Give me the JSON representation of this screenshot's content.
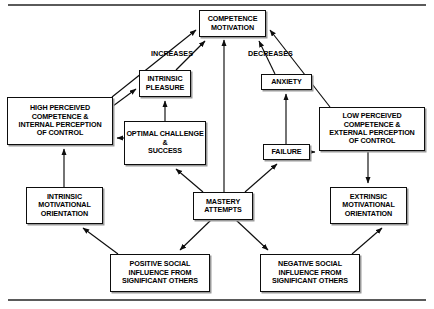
{
  "diagram": {
    "frame": {
      "top_rule": true,
      "bottom_rule": true,
      "rule_color": "#5a5a5a"
    },
    "nodes": [
      {
        "id": "competence-motivation",
        "text": "COMPETENCE\nMOTIVATION",
        "x": 199,
        "y": 10,
        "w": 67,
        "h": 27,
        "font": 7.2
      },
      {
        "id": "intrinsic-pleasure",
        "text": "INTRINSIC\nPLEASURE",
        "x": 139,
        "y": 70,
        "w": 52,
        "h": 27,
        "font": 7.2
      },
      {
        "id": "anxiety",
        "text": "ANXIETY",
        "x": 261,
        "y": 74,
        "w": 51,
        "h": 16,
        "font": 7.2
      },
      {
        "id": "high-perceived-competence",
        "text": "HIGH PERCEIVED\nCOMPETENCE &\nINTERNAL PERCEPTION\nOF CONTROL",
        "x": 7,
        "y": 97,
        "w": 106,
        "h": 48,
        "font": 7.2
      },
      {
        "id": "low-perceived-competence",
        "text": "LOW PERCEIVED\nCOMPETENCE &\nEXTERNAL PERCEPTION\nOF CONTROL",
        "x": 319,
        "y": 107,
        "w": 106,
        "h": 44,
        "font": 7.2
      },
      {
        "id": "optimal-challenge-success",
        "text": "OPTIMAL CHALLENGE\n&\nSUCCESS",
        "x": 124,
        "y": 121,
        "w": 82,
        "h": 44,
        "font": 7.2
      },
      {
        "id": "failure",
        "text": "FAILURE",
        "x": 263,
        "y": 144,
        "w": 47,
        "h": 16,
        "font": 7.2
      },
      {
        "id": "intrinsic-motivational-orientation",
        "text": "INTRINSIC\nMOTIVATIONAL\nORIENTATION",
        "x": 26,
        "y": 187,
        "w": 77,
        "h": 37,
        "font": 7.2
      },
      {
        "id": "mastery-attempts",
        "text": "MASTERY\nATTEMPTS",
        "x": 193,
        "y": 192,
        "w": 60,
        "h": 28,
        "font": 7.2
      },
      {
        "id": "extrinsic-motivational-orientation",
        "text": "EXTRINSIC\nMOTIVATIONAL\nORIENTATION",
        "x": 330,
        "y": 187,
        "w": 77,
        "h": 37,
        "font": 7.2
      },
      {
        "id": "positive-social-influence",
        "text": "POSITIVE SOCIAL\nINFLUENCE FROM\nSIGNIFICANT OTHERS",
        "x": 110,
        "y": 254,
        "w": 100,
        "h": 38,
        "font": 7.2
      },
      {
        "id": "negative-social-influence",
        "text": "NEGATIVE SOCIAL\nINFLUENCE FROM\nSIGNIFICANT OTHERS",
        "x": 260,
        "y": 254,
        "w": 100,
        "h": 38,
        "font": 7.2
      }
    ],
    "edge_labels": [
      {
        "id": "increases-label",
        "text": "INCREASES",
        "x": 151,
        "y": 49,
        "font": 7.2
      },
      {
        "id": "decreases-label",
        "text": "DECREASES",
        "x": 248,
        "y": 49,
        "font": 7.2
      }
    ],
    "edges": [
      {
        "id": "high-perceived-to-competence-motivation",
        "from": "high-perceived-competence",
        "to": "competence-motivation"
      },
      {
        "id": "intrinsic-pleasure-to-competence-motivation",
        "from": "intrinsic-pleasure",
        "to": "competence-motivation"
      },
      {
        "id": "mastery-attempts-to-competence-motivation",
        "from": "mastery-attempts",
        "to": "competence-motivation"
      },
      {
        "id": "anxiety-to-competence-motivation",
        "from": "anxiety",
        "to": "competence-motivation"
      },
      {
        "id": "low-perceived-to-competence-motivation",
        "from": "low-perceived-competence",
        "to": "competence-motivation"
      },
      {
        "id": "high-perceived-to-intrinsic-pleasure",
        "from": "high-perceived-competence",
        "to": "intrinsic-pleasure"
      },
      {
        "id": "optimal-challenge-to-intrinsic-pleasure",
        "from": "optimal-challenge-success",
        "to": "intrinsic-pleasure"
      },
      {
        "id": "optimal-challenge-to-high-perceived",
        "from": "optimal-challenge-success",
        "to": "high-perceived-competence"
      },
      {
        "id": "failure-to-anxiety",
        "from": "failure",
        "to": "anxiety"
      },
      {
        "id": "failure-to-low-perceived",
        "from": "failure",
        "to": "low-perceived-competence"
      },
      {
        "id": "intrinsic-orientation-to-high-perceived",
        "from": "intrinsic-motivational-orientation",
        "to": "high-perceived-competence"
      },
      {
        "id": "low-perceived-to-extrinsic-orientation",
        "from": "low-perceived-competence",
        "to": "extrinsic-motivational-orientation"
      },
      {
        "id": "mastery-attempts-to-optimal-challenge",
        "from": "mastery-attempts",
        "to": "optimal-challenge-success"
      },
      {
        "id": "mastery-attempts-to-failure",
        "from": "mastery-attempts",
        "to": "failure"
      },
      {
        "id": "mastery-attempts-to-positive-social",
        "from": "mastery-attempts",
        "to": "positive-social-influence"
      },
      {
        "id": "mastery-attempts-to-negative-social",
        "from": "mastery-attempts",
        "to": "negative-social-influence"
      },
      {
        "id": "positive-social-to-intrinsic-orientation",
        "from": "positive-social-influence",
        "to": "intrinsic-motivational-orientation"
      },
      {
        "id": "negative-social-to-extrinsic-orientation",
        "from": "negative-social-influence",
        "to": "extrinsic-motivational-orientation"
      }
    ]
  }
}
